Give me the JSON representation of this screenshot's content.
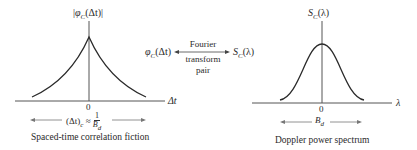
{
  "left_plot": {
    "y_axis_label": "|φC(Δt)|",
    "y_axis_label_parts": {
      "open": "|",
      "func": "φ",
      "sub": "C",
      "arg": "(Δt)",
      "close": "|"
    },
    "x_axis_label": "Δt",
    "origin_tick": "0",
    "width_annotation": {
      "lhs": "(Δt)",
      "lhs_sub": "c",
      "approx": "≈",
      "num": "1",
      "den": "B",
      "den_sub": "d"
    },
    "caption": "Spaced-time correlation fiction",
    "curve_shape": "double-sided decaying exponential (cusp at 0)"
  },
  "center": {
    "left_term": {
      "func": "φ",
      "sub": "C",
      "arg": "(Δt)"
    },
    "right_term": {
      "func": "S",
      "sub": "C",
      "arg": "(λ)"
    },
    "arrow_label_line1": "Fourier",
    "arrow_label_line2": "transform",
    "arrow_label_line3": "pair"
  },
  "right_plot": {
    "y_axis_label_parts": {
      "func": "S",
      "sub": "C",
      "arg": "(λ)"
    },
    "x_axis_label": "λ",
    "origin_tick": "0",
    "width_annotation": {
      "sym": "B",
      "sub": "d"
    },
    "caption": "Doppler power spectrum",
    "curve_shape": "bell-shaped"
  },
  "colors": {
    "line": "#2a2a2a",
    "axis": "#555555",
    "fringe_green": "#3a9a3a"
  }
}
